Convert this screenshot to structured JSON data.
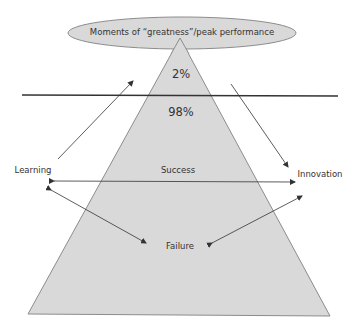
{
  "diagram": {
    "ellipse_label": "Moments of “greatness”/peak performance",
    "top_percent": "2%",
    "bottom_percent": "98%",
    "left_label": "Learning",
    "right_label": "Innovation",
    "middle_label": "Success",
    "bottom_label": "Failure"
  },
  "colors": {
    "fill": "#d9d9d9",
    "stroke": "#8c8c8c",
    "line": "#333333",
    "text": "#333333"
  }
}
